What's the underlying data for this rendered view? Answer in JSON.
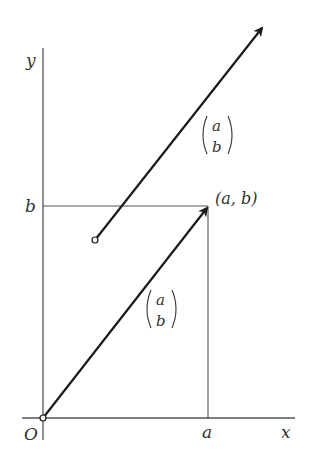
{
  "diagram": {
    "axes": {
      "x_label": "x",
      "y_label": "y",
      "origin_label": "O",
      "x_tick_label": "a",
      "y_tick_label": "b"
    },
    "point_label": "(a, b)",
    "vectors": [
      {
        "name": "position-vector",
        "top": "a",
        "bottom": "b",
        "from": "O",
        "to": "(a, b)"
      },
      {
        "name": "translated-vector",
        "top": "a",
        "bottom": "b",
        "from": "tail point",
        "to": "head"
      }
    ],
    "colors": {
      "ink": "#222222",
      "axis": "#555555",
      "background": "#ffffff"
    }
  }
}
